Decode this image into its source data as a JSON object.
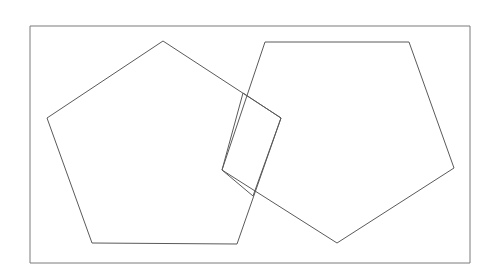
{
  "canvas": {
    "width": 498,
    "height": 277,
    "background": "#ffffff"
  },
  "figure": {
    "stroke_color": "#5a5a5a",
    "frame_stroke_color": "#7a7a7a",
    "fill": "none",
    "stroke_width": 1
  },
  "shapes": [
    {
      "name": "frame",
      "kind": "rectangle",
      "stroke": "#7a7a7a",
      "fill": "none",
      "stroke_width": 1,
      "points": "30,26 470,26 470,263 30,263"
    },
    {
      "name": "pentagon-left",
      "kind": "pentagon",
      "stroke": "#5a5a5a",
      "fill": "none",
      "stroke_width": 1,
      "points": "163,41 281,118 237,244 92,243 47,118"
    },
    {
      "name": "pentagon-right",
      "kind": "pentagon",
      "stroke": "#5a5a5a",
      "fill": "none",
      "stroke_width": 1,
      "points": "265,42 409,42 454,168 337,243 222,170"
    },
    {
      "name": "quadrilateral-center",
      "kind": "quadrilateral",
      "stroke": "#5a5a5a",
      "fill": "none",
      "stroke_width": 1,
      "points": "243,93 281,118 253,196 222,170"
    }
  ]
}
